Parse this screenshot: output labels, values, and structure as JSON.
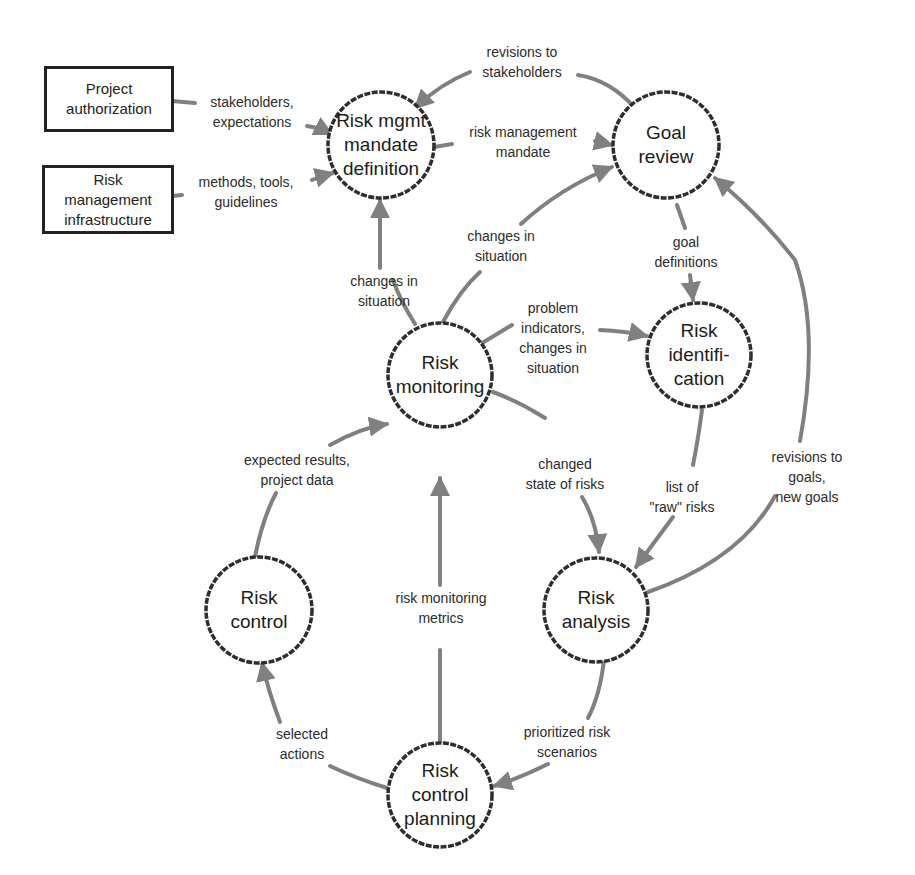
{
  "diagram": {
    "type": "risk management process flow",
    "colors": {
      "node_border": "#2e2e2e",
      "edge": "#808080",
      "text": "#2a2a2a",
      "background": "#ffffff"
    },
    "sources": [
      {
        "id": "project-authorization",
        "label": "Project\nauthorization"
      },
      {
        "id": "risk-management-infrastructure",
        "label": "Risk\nmanagement\ninfrastructure"
      }
    ],
    "processes": [
      {
        "id": "mandate",
        "label": "Risk mgmt\nmandate\ndefinition"
      },
      {
        "id": "goal-review",
        "label": "Goal\nreview"
      },
      {
        "id": "identification",
        "label": "Risk\nidentifi-\ncation"
      },
      {
        "id": "monitoring",
        "label": "Risk\nmonitoring"
      },
      {
        "id": "analysis",
        "label": "Risk\nanalysis"
      },
      {
        "id": "control",
        "label": "Risk\ncontrol"
      },
      {
        "id": "planning",
        "label": "Risk\ncontrol\nplanning"
      }
    ],
    "flows": [
      {
        "from": "project-authorization",
        "to": "mandate",
        "label": "stakeholders,\nexpectations"
      },
      {
        "from": "risk-management-infrastructure",
        "to": "mandate",
        "label": "methods, tools,\nguidelines"
      },
      {
        "from": "goal-review",
        "to": "mandate",
        "label": "revisions to\nstakeholders"
      },
      {
        "from": "mandate",
        "to": "goal-review",
        "label": "risk management\nmandate"
      },
      {
        "from": "monitoring",
        "to": "mandate",
        "label": "changes in\nsituation"
      },
      {
        "from": "monitoring",
        "to": "goal-review",
        "label": "changes in\nsituation"
      },
      {
        "from": "goal-review",
        "to": "identification",
        "label": "goal\ndefinitions"
      },
      {
        "from": "monitoring",
        "to": "identification",
        "label": "problem\nindicators,\nchanges in\nsituation"
      },
      {
        "from": "identification",
        "to": "analysis",
        "label": "list of\n\"raw\" risks"
      },
      {
        "from": "analysis",
        "to": "goal-review",
        "label": "revisions to goals,\nnew goals"
      },
      {
        "from": "monitoring",
        "to": "analysis",
        "label": "changed\nstate of risks"
      },
      {
        "from": "control",
        "to": "monitoring",
        "label": "expected results,\nproject data"
      },
      {
        "from": "planning",
        "to": "monitoring",
        "label": "risk monitoring\nmetrics"
      },
      {
        "from": "analysis",
        "to": "planning",
        "label": "prioritized risk\nscenarios"
      },
      {
        "from": "planning",
        "to": "control",
        "label": "selected\nactions"
      }
    ]
  }
}
